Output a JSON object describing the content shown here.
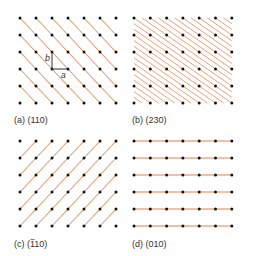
{
  "figure": {
    "line_color": "#e8804a",
    "dot_color": "#111111",
    "vector_color": "#333333",
    "panels": [
      {
        "id": "a",
        "caption": "(a) (110)",
        "miller": [
          1,
          1,
          0
        ],
        "origin": [
          20,
          18
        ],
        "cols": 7,
        "rows": 6,
        "dx": 16,
        "dy": 17,
        "caption_pos": [
          14,
          123
        ],
        "unit_cell_vectors": {
          "origin_col": 2,
          "origin_row": 3,
          "a_label": "a",
          "b_label": "b"
        }
      },
      {
        "id": "b",
        "caption": "(b) (230)",
        "miller": [
          2,
          3,
          0
        ],
        "origin": [
          134,
          18
        ],
        "cols": 7,
        "rows": 6,
        "dx": 16.3,
        "dy": 17,
        "caption_pos": [
          132,
          123
        ]
      },
      {
        "id": "c",
        "caption_prefix": "(c) (",
        "caption_bar": "1",
        "caption_suffix": "10)",
        "miller": [
          -1,
          1,
          0
        ],
        "origin": [
          20,
          141
        ],
        "cols": 7,
        "rows": 6,
        "dx": 16,
        "dy": 17,
        "caption_pos": [
          14,
          247
        ]
      },
      {
        "id": "d",
        "caption": "(d) (010)",
        "miller": [
          0,
          1,
          0
        ],
        "origin": [
          134,
          141
        ],
        "cols": 7,
        "rows": 6,
        "dx": 16.3,
        "dy": 17,
        "caption_pos": [
          132,
          247
        ]
      }
    ]
  }
}
